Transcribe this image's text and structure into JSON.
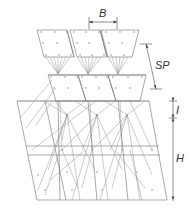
{
  "diagram": {
    "type": "layered-panel-connection-diagram",
    "colors": {
      "line": "#6e6e6e",
      "dimension": "#444444",
      "label": "#333333",
      "background": "#ffffff"
    },
    "labels": {
      "width_label": "B",
      "spacing_label": "SP",
      "offset_label": "I",
      "height_label": "H"
    },
    "layers": [
      {
        "name": "top-panels",
        "panel_count": 3
      },
      {
        "name": "middle-panels",
        "panel_count": 3
      },
      {
        "name": "bottom-field",
        "panel_count": 3
      }
    ]
  }
}
